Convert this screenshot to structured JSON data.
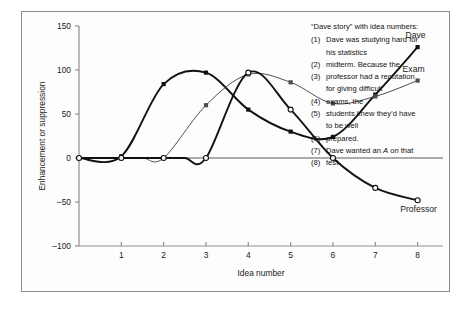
{
  "figure": {
    "background": "#fdfdfd",
    "border_color": "#8a8a8a"
  },
  "chart_data": {
    "type": "line",
    "title": "",
    "xlabel": "Idea number",
    "ylabel": "Enhancement or suppression",
    "xlim": [
      0,
      8.6
    ],
    "ylim": [
      -100,
      150
    ],
    "xticks": [
      1,
      2,
      3,
      4,
      5,
      6,
      7,
      8
    ],
    "xtick_labels": [
      "1",
      "2",
      "3",
      "4",
      "5",
      "6",
      "7",
      "8"
    ],
    "yticks": [
      -100,
      -50,
      0,
      50,
      100,
      150
    ],
    "ytick_labels": [
      "-100",
      "-50",
      "0",
      "50",
      "100",
      "150"
    ],
    "grid": false,
    "legend_position": "inline-end-labels",
    "zero_line": true,
    "zero_line_color": "#8f8f8f",
    "series": [
      {
        "name": "Dave",
        "label": "Dave",
        "color": "#111111",
        "marker": "filled-square",
        "x": [
          0,
          1,
          2,
          3,
          4,
          5,
          6,
          7,
          8
        ],
        "values": [
          0,
          2,
          84,
          97,
          55,
          30,
          24,
          72,
          126
        ]
      },
      {
        "name": "Exam",
        "label": "Exam",
        "color": "#4d4d4d",
        "marker": "filled-square",
        "x": [
          0,
          1,
          2,
          3,
          4,
          5,
          6,
          7,
          8
        ],
        "values": [
          0,
          0,
          0,
          60,
          95,
          86,
          62,
          70,
          88
        ]
      },
      {
        "name": "Professor",
        "label": "Professor",
        "color": "#111111",
        "marker": "open-circle",
        "x": [
          0,
          1,
          2,
          3,
          4,
          5,
          6,
          7,
          8
        ],
        "values": [
          0,
          0,
          0,
          0,
          97,
          55,
          0,
          -34,
          -48
        ]
      }
    ]
  },
  "story": {
    "title": "“Dave story” with idea numbers:",
    "items": [
      {
        "num": "(1)",
        "text_before": "Dave was studying hard for",
        "emphasis": "",
        "text_after": ""
      },
      {
        "num": "",
        "text_before": "his statistics",
        "emphasis": "",
        "text_after": ""
      },
      {
        "num": "(2)",
        "text_before": "midterm. Because the",
        "emphasis": "",
        "text_after": ""
      },
      {
        "num": "(3)",
        "text_before": "professor had a reputation",
        "emphasis": "",
        "text_after": ""
      },
      {
        "num": "",
        "text_before": "for giving difficult",
        "emphasis": "",
        "text_after": ""
      },
      {
        "num": "(4)",
        "text_before": "exams, the",
        "emphasis": "",
        "text_after": ""
      },
      {
        "num": "(5)",
        "text_before": "students knew they’d have",
        "emphasis": "",
        "text_after": ""
      },
      {
        "num": "",
        "text_before": "to be well",
        "emphasis": "",
        "text_after": ""
      },
      {
        "num": "(6)",
        "text_before": "prepared.",
        "emphasis": "",
        "text_after": ""
      },
      {
        "num": "(7)",
        "text_before": "Dave wanted an ",
        "emphasis": "A",
        "text_after": " on that"
      },
      {
        "num": "(8)",
        "text_before": "test.",
        "emphasis": "",
        "text_after": ""
      }
    ]
  }
}
